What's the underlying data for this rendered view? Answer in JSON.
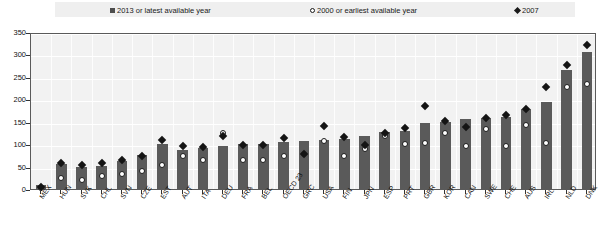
{
  "chart_data": {
    "type": "bar",
    "title": "",
    "xlabel": "",
    "ylabel": "",
    "ylim": [
      0,
      350
    ],
    "ytick_step": 50,
    "yticks": [
      0,
      50,
      100,
      150,
      200,
      250,
      300,
      350
    ],
    "grid": true,
    "legend_position": "top",
    "categories": [
      "MEX",
      "HUN",
      "SVK",
      "CHL",
      "SVN",
      "CZE",
      "EST",
      "AUT",
      "ITA",
      "DEU",
      "FRA",
      "BEL",
      "OECD 23",
      "GRC",
      "USA",
      "FIN",
      "JPN",
      "ESP",
      "PRT",
      "GBR",
      "KOR",
      "CAN",
      "SWE",
      "CHE",
      "AUS",
      "IRL",
      "NLD",
      "DNK"
    ],
    "series": [
      {
        "name": "2013 or latest available year",
        "marker": "square",
        "color": "#5a5a5a",
        "render": "bar",
        "values": [
          8,
          55,
          50,
          52,
          62,
          75,
          100,
          88,
          92,
          96,
          100,
          100,
          105,
          108,
          110,
          112,
          118,
          128,
          130,
          148,
          150,
          155,
          158,
          160,
          178,
          195,
          265,
          305
        ]
      },
      {
        "name": "2000 or earliest available year",
        "marker": "open-circle",
        "color": "#ffffff",
        "render": "point",
        "values": [
          6,
          30,
          25,
          33,
          38,
          45,
          57,
          77,
          68,
          130,
          70,
          70,
          78,
          82,
          112,
          78,
          93,
          122,
          105,
          108,
          130,
          100,
          138,
          100,
          148,
          107,
          232,
          238
        ]
      },
      {
        "name": "2007",
        "marker": "filled-diamond",
        "color": "#141414",
        "render": "point",
        "values": [
          8,
          63,
          58,
          62,
          70,
          78,
          113,
          100,
          98,
          122,
          103,
          102,
          118,
          82,
          145,
          120,
          102,
          130,
          140,
          190,
          157,
          142,
          163,
          170,
          182,
          232,
          280,
          325
        ]
      }
    ]
  },
  "legend": {
    "items": [
      {
        "label": "2013 or latest available year",
        "marker": "square"
      },
      {
        "label": "2000 or earliest available year",
        "marker": "open-circle"
      },
      {
        "label": "2007",
        "marker": "filled-diamond"
      }
    ]
  },
  "colors": {
    "bar": "#5a5a5a",
    "diamond": "#141414",
    "circle_fill": "#ffffff",
    "circle_stroke": "#1a1a1a",
    "plot_background": "#f2f2f2",
    "legend_background": "#efefef",
    "gridline": "#ffffff",
    "axis": "#5a5a5a"
  }
}
